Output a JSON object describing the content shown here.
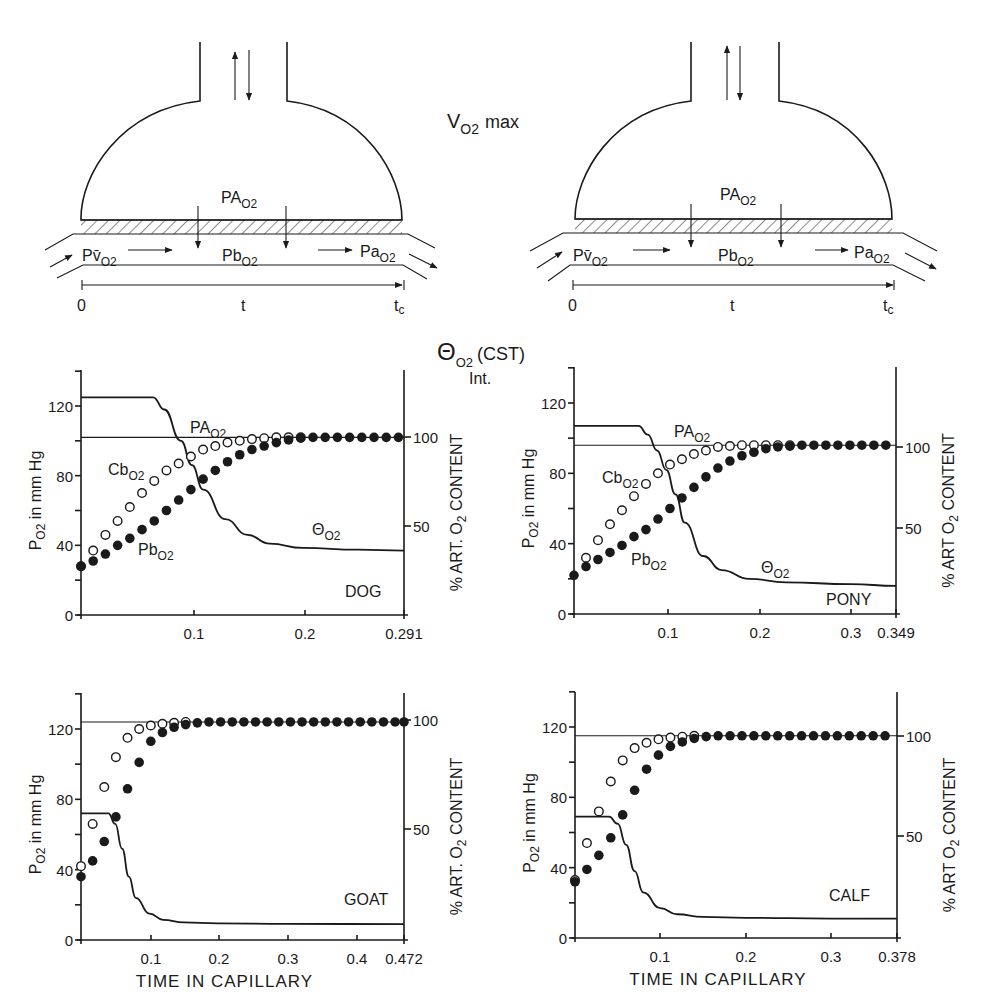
{
  "header": {
    "vo2_label": "V",
    "vo2_sub": "O2",
    "vo2_suffix": "max",
    "theta_label": "Θ",
    "theta_sub": "O2",
    "theta_suffix": "(CST)",
    "int_label": "Int."
  },
  "diagram": {
    "alveolar_label": "PA",
    "alveolar_sub": "O2",
    "venous_label": "Pv̄",
    "venous_sub": "O2",
    "blood_label": "Pb",
    "blood_sub": "O2",
    "arterial_label": "Pa",
    "arterial_sub": "O2",
    "time_start": "0",
    "time_mid": "t",
    "time_end": "t",
    "time_end_sub": "c"
  },
  "chart_data": [
    {
      "type": "line",
      "animal": "DOG",
      "title": "",
      "xlabel": "",
      "ylabel": "PO2 in mm Hg",
      "y2label": "% ART. O2 CONTENT",
      "xlim": [
        0,
        0.291
      ],
      "ylim": [
        0,
        140
      ],
      "xticks": [
        "0.1",
        "0.2",
        "0.291"
      ],
      "yticks": [
        "0",
        "40",
        "80",
        "120"
      ],
      "y2ticks": [
        "50",
        "100"
      ],
      "PAO2_mmHg": 102,
      "series": [
        {
          "name": "ΘO2",
          "style": "solid line",
          "x": [
            0,
            0.065,
            0.075,
            0.09,
            0.1,
            0.11,
            0.13,
            0.15,
            0.17,
            0.2,
            0.25,
            0.291
          ],
          "values": [
            125,
            125,
            118,
            100,
            86,
            72,
            55,
            46,
            41,
            38.5,
            37.5,
            37
          ]
        },
        {
          "name": "CbO2",
          "style": "open circles",
          "x": [
            0,
            0.011,
            0.022,
            0.033,
            0.044,
            0.055,
            0.066,
            0.077,
            0.088,
            0.099,
            0.11,
            0.121,
            0.132,
            0.143,
            0.154,
            0.165,
            0.176,
            0.187,
            0.198
          ],
          "values": [
            28,
            37,
            46,
            54,
            62,
            70,
            77,
            83,
            87,
            91,
            95,
            97,
            99,
            100,
            101,
            101.5,
            102,
            102,
            102
          ]
        },
        {
          "name": "PbO2",
          "style": "filled circles",
          "x": [
            0,
            0.011,
            0.022,
            0.033,
            0.044,
            0.055,
            0.066,
            0.077,
            0.088,
            0.099,
            0.11,
            0.121,
            0.132,
            0.143,
            0.154,
            0.165,
            0.176,
            0.187,
            0.198,
            0.209,
            0.22,
            0.231,
            0.242,
            0.253,
            0.264,
            0.275,
            0.286
          ],
          "values": [
            28,
            31,
            35,
            40,
            44,
            49,
            54,
            60,
            66,
            72,
            78,
            83,
            88,
            92,
            95,
            97,
            99,
            100.5,
            101.5,
            102,
            102,
            102,
            102,
            102,
            102,
            102,
            102
          ]
        }
      ],
      "annotations": [
        "PAO2",
        "CbO2",
        "PbO2",
        "ΘO2",
        "DOG"
      ]
    },
    {
      "type": "line",
      "animal": "PONY",
      "title": "",
      "xlabel": "",
      "ylabel": "PO2 in mm Hg",
      "y2label": "% ART O2 CONTENT",
      "xlim": [
        0,
        0.349
      ],
      "ylim": [
        0,
        140
      ],
      "xticks": [
        "0.1",
        "0.2",
        "0.3",
        "0.349"
      ],
      "yticks": [
        "0",
        "40",
        "80",
        "120"
      ],
      "y2ticks": [
        "50",
        "100"
      ],
      "PAO2_mmHg": 96,
      "series": [
        {
          "name": "ΘO2",
          "style": "solid line",
          "x": [
            0,
            0.07,
            0.08,
            0.09,
            0.1,
            0.11,
            0.12,
            0.14,
            0.16,
            0.19,
            0.23,
            0.3,
            0.349
          ],
          "values": [
            107,
            107,
            102,
            93,
            82,
            68,
            52,
            33,
            25,
            20,
            18,
            17,
            16
          ]
        },
        {
          "name": "CbO2",
          "style": "open circles",
          "x": [
            0.013,
            0.026,
            0.039,
            0.052,
            0.065,
            0.078,
            0.091,
            0.104,
            0.117,
            0.13,
            0.143,
            0.156,
            0.169,
            0.182,
            0.195,
            0.208,
            0.221,
            0.234
          ],
          "values": [
            32,
            42,
            51,
            59,
            67,
            74,
            80,
            85,
            88,
            91,
            93,
            95,
            95.5,
            96,
            96,
            96,
            96,
            96
          ]
        },
        {
          "name": "PbO2",
          "style": "filled circles",
          "x": [
            0,
            0.013,
            0.026,
            0.039,
            0.052,
            0.065,
            0.078,
            0.091,
            0.104,
            0.117,
            0.13,
            0.143,
            0.156,
            0.169,
            0.182,
            0.195,
            0.208,
            0.221,
            0.234,
            0.247,
            0.26,
            0.273,
            0.286,
            0.299,
            0.312,
            0.325,
            0.338
          ],
          "values": [
            22,
            27,
            31,
            35,
            39,
            44,
            48,
            54,
            60,
            66,
            72,
            78,
            83,
            87,
            90,
            92,
            94,
            95,
            95.5,
            96,
            96,
            96,
            96,
            96,
            96,
            96,
            96
          ]
        }
      ],
      "annotations": [
        "PAO2",
        "CbO2",
        "PbO2",
        "ΘO2",
        "PONY"
      ]
    },
    {
      "type": "line",
      "animal": "GOAT",
      "title": "",
      "xlabel": "TIME IN CAPILLARY",
      "ylabel": "PO2 in mm Hg",
      "y2label": "% ART. O2 CONTENT",
      "xlim": [
        0,
        0.472
      ],
      "ylim": [
        0,
        140
      ],
      "xticks": [
        "0.1",
        "0.2",
        "0.3",
        "0.4",
        "0.472"
      ],
      "yticks": [
        "0",
        "40",
        "80",
        "120"
      ],
      "y2ticks": [
        "50",
        "100"
      ],
      "PAO2_mmHg": 124,
      "series": [
        {
          "name": "ΘO2",
          "style": "solid line",
          "x": [
            0,
            0.04,
            0.05,
            0.06,
            0.07,
            0.08,
            0.1,
            0.12,
            0.15,
            0.2,
            0.3,
            0.472
          ],
          "values": [
            72,
            72,
            66,
            52,
            36,
            24,
            15,
            11.5,
            10,
            9.5,
            9.2,
            9
          ]
        },
        {
          "name": "CbO2",
          "style": "open circles",
          "x": [
            0,
            0.017,
            0.034,
            0.051,
            0.068,
            0.085,
            0.102,
            0.119,
            0.136,
            0.153
          ],
          "values": [
            42,
            66,
            87,
            104,
            115,
            120,
            122,
            123,
            123.5,
            124
          ]
        },
        {
          "name": "PbO2",
          "style": "filled circles",
          "x": [
            0,
            0.017,
            0.034,
            0.051,
            0.068,
            0.085,
            0.102,
            0.119,
            0.136,
            0.153,
            0.17,
            0.187,
            0.204,
            0.221,
            0.238,
            0.255,
            0.272,
            0.289,
            0.306,
            0.323,
            0.34,
            0.357,
            0.374,
            0.391,
            0.408,
            0.425,
            0.442,
            0.459,
            0.472
          ],
          "values": [
            36,
            45,
            56,
            70,
            86,
            101,
            113,
            118,
            121,
            122.5,
            123.5,
            124,
            124,
            124,
            124,
            124,
            124,
            124,
            124,
            124,
            124,
            124,
            124,
            124,
            124,
            124,
            124,
            124,
            124
          ]
        }
      ],
      "annotations": [
        "GOAT"
      ]
    },
    {
      "type": "line",
      "animal": "CALF",
      "title": "",
      "xlabel": "TIME IN CAPILLARY",
      "ylabel": "PO2 in mm Hg",
      "y2label": "% ART O2 CONTENT",
      "xlim": [
        0,
        0.378
      ],
      "ylim": [
        0,
        140
      ],
      "xticks": [
        "0.1",
        "0.2",
        "0.3",
        "0.378"
      ],
      "yticks": [
        "0",
        "40",
        "80",
        "120"
      ],
      "y2ticks": [
        "50",
        "100"
      ],
      "PAO2_mmHg": 115,
      "series": [
        {
          "name": "ΘO2",
          "style": "solid line",
          "x": [
            0,
            0.04,
            0.05,
            0.06,
            0.07,
            0.08,
            0.1,
            0.12,
            0.15,
            0.2,
            0.3,
            0.378
          ],
          "values": [
            69,
            69,
            65,
            53,
            38,
            26,
            17,
            13.5,
            12,
            11.5,
            11,
            11
          ]
        },
        {
          "name": "CbO2",
          "style": "open circles",
          "x": [
            0,
            0.014,
            0.028,
            0.042,
            0.056,
            0.07,
            0.084,
            0.098,
            0.112,
            0.126,
            0.14
          ],
          "values": [
            33,
            54,
            72,
            89,
            101,
            108,
            111,
            113,
            114,
            114.5,
            115
          ]
        },
        {
          "name": "PbO2",
          "style": "filled circles",
          "x": [
            0,
            0.014,
            0.028,
            0.042,
            0.056,
            0.07,
            0.084,
            0.098,
            0.112,
            0.126,
            0.14,
            0.154,
            0.168,
            0.182,
            0.196,
            0.21,
            0.224,
            0.238,
            0.252,
            0.266,
            0.28,
            0.294,
            0.308,
            0.322,
            0.336,
            0.35,
            0.364
          ],
          "values": [
            32,
            39,
            47,
            57,
            70,
            84,
            96,
            104,
            109,
            111.5,
            113.5,
            114.5,
            115,
            115,
            115,
            115,
            115,
            115,
            115,
            115,
            115,
            115,
            115,
            115,
            115,
            115,
            115
          ]
        }
      ],
      "annotations": [
        "CALF"
      ]
    }
  ],
  "labels": {
    "PAO2": "PA",
    "PAO2_sub": "O2",
    "CbO2": "Cb",
    "CbO2_sub": "O2",
    "PbO2": "Pb",
    "PbO2_sub": "O2",
    "theta": "Θ",
    "theta_sub": "O2",
    "ylabel_main": "P",
    "ylabel_sub": "O2",
    "ylabel_rest": " in mm Hg",
    "y2label_pre": "% ART. O",
    "y2label_sub": "2",
    "y2label_post": " CONTENT"
  }
}
